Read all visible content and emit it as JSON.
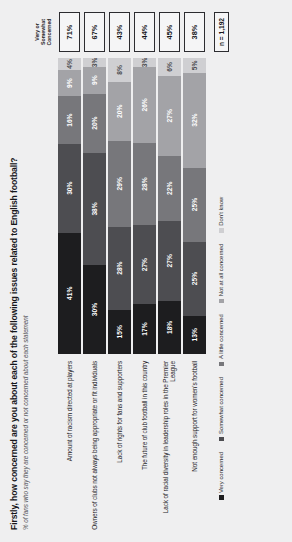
{
  "chart_data": {
    "type": "bar",
    "title": "Firstly, how concerned are you about each of the following issues related to English football?",
    "subtitle": "% of fans who say they are concerned or not concerned about each statement",
    "xlabel": "",
    "ylabel": "",
    "xlim": [
      0,
      100
    ],
    "grid": false,
    "legend_position": "bottom",
    "orientation": "horizontal-stacked",
    "categories": [
      "Amount of racism directed at players",
      "Owners of clubs not always being appropriate or fit individuals",
      "Lack of rights for fans and supporters",
      "The future of club football in this country",
      "Lack of racial diversity in leadership roles in the Premier League",
      "Not enough support for women's football"
    ],
    "series": [
      {
        "name": "Very concerned",
        "color": "#1d1d1f",
        "values": [
          41,
          30,
          15,
          17,
          18,
          13
        ]
      },
      {
        "name": "Somewhat concerned",
        "color": "#4d4d51",
        "values": [
          30,
          38,
          28,
          27,
          27,
          25
        ]
      },
      {
        "name": "A little concerned",
        "color": "#77777b",
        "values": [
          16,
          20,
          29,
          28,
          22,
          25
        ]
      },
      {
        "name": "Not at all concerned",
        "color": "#a3a3a7",
        "values": [
          9,
          9,
          20,
          26,
          27,
          32
        ]
      },
      {
        "name": "Don't know",
        "color": "#cfcfd2",
        "values": [
          4,
          3,
          8,
          3,
          6,
          5
        ]
      }
    ],
    "value_labels": [
      [
        "41%",
        "30%",
        "16%",
        "9%",
        "4%"
      ],
      [
        "30%",
        "38%",
        "20%",
        "9%",
        "3%"
      ],
      [
        "15%",
        "28%",
        "29%",
        "20%",
        "8%"
      ],
      [
        "17%",
        "27%",
        "28%",
        "26%",
        "3%"
      ],
      [
        "18%",
        "27%",
        "22%",
        "27%",
        "6%"
      ],
      [
        "13%",
        "25%",
        "25%",
        "32%",
        "5%"
      ]
    ],
    "summary_column_header": "Very or Somewhat Concerned",
    "summary_values": [
      "71%",
      "67%",
      "43%",
      "44%",
      "45%",
      "38%"
    ],
    "base_note": "n = 1,192"
  }
}
